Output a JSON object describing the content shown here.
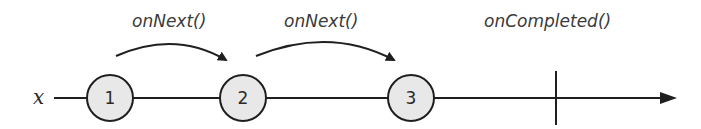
{
  "diagram": {
    "observable_label": "x",
    "events": [
      {
        "type": "onNext",
        "value": "1"
      },
      {
        "type": "onNext",
        "value": "2"
      },
      {
        "type": "onNext",
        "value": "3"
      },
      {
        "type": "onCompleted",
        "value": ""
      }
    ],
    "annotations": [
      {
        "label": "onNext()",
        "from": "1",
        "to": "2"
      },
      {
        "label": "onNext()",
        "from": "2",
        "to": "3"
      },
      {
        "label": "onCompleted()",
        "at": "completion-marker"
      }
    ],
    "colors": {
      "line": "#1f1f1f",
      "marble_fill": "#e8e8e8",
      "text": "#3a3a3a"
    }
  }
}
